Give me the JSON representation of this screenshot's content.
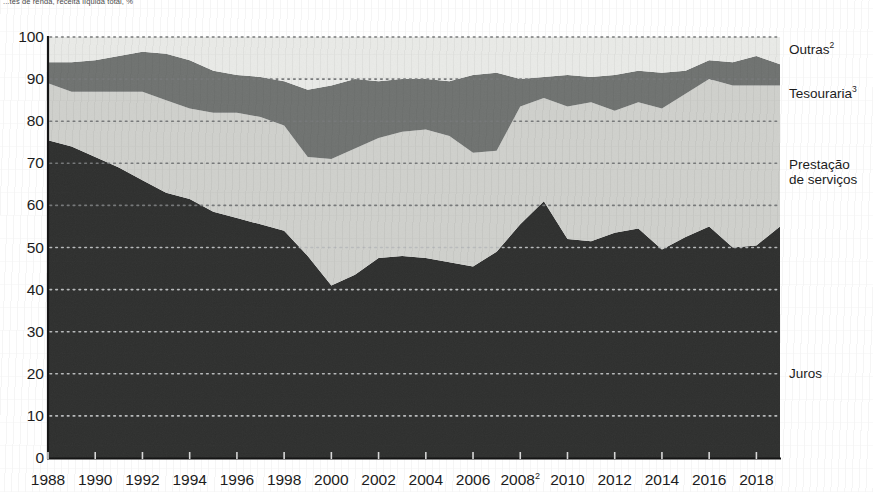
{
  "caption": "...tes de renda, receita líquida total, %",
  "legend": [
    {
      "key": "outras",
      "label": "Outras",
      "sup": "2",
      "color": "#e9eae7"
    },
    {
      "key": "tesouraria",
      "label": "Tesouraria",
      "sup": "3",
      "color": "#6f7270"
    },
    {
      "key": "prestacao",
      "label": "Prestação",
      "sup": "",
      "color": "#cfd0cc"
    },
    {
      "key": "prestacao2",
      "label": "de serviços",
      "sup": "",
      "color": "#cfd0cc"
    },
    {
      "key": "juros",
      "label": "Juros",
      "sup": "",
      "color": "#2e2f2e"
    }
  ],
  "axis": {
    "y_ticks": [
      0,
      10,
      20,
      30,
      40,
      50,
      60,
      70,
      80,
      90,
      100
    ],
    "x_ticks": [
      "1988",
      "1990",
      "1992",
      "1994",
      "1996",
      "1998",
      "2000",
      "2002",
      "2004",
      "2006",
      "2008",
      "2010",
      "2012",
      "2014",
      "2016",
      "2018"
    ],
    "x_tick_sup": {
      "2008": "2"
    }
  },
  "chart_data": {
    "type": "area",
    "stacked": true,
    "normalized_percent": true,
    "title": "",
    "subtitle": "...tes de renda, receita líquida total, %",
    "xlabel": "",
    "ylabel": "%",
    "ylim": [
      0,
      100
    ],
    "xlim": [
      1988,
      2019
    ],
    "grid": "horizontal-dotted",
    "legend_position": "right-inline",
    "x": [
      1988,
      1989,
      1990,
      1991,
      1992,
      1993,
      1994,
      1995,
      1996,
      1997,
      1998,
      1999,
      2000,
      2001,
      2002,
      2003,
      2004,
      2005,
      2006,
      2007,
      2008,
      2009,
      2010,
      2011,
      2012,
      2013,
      2014,
      2015,
      2016,
      2017,
      2018,
      2019
    ],
    "series": [
      {
        "name": "Juros",
        "color": "#2e2f2e",
        "values": [
          75.5,
          74.0,
          71.5,
          69.0,
          66.0,
          63.0,
          61.5,
          58.5,
          57.0,
          55.5,
          54.0,
          48.0,
          41.0,
          43.5,
          47.5,
          48.0,
          47.5,
          46.5,
          45.5,
          49.0,
          55.5,
          61.0,
          52.0,
          51.5,
          53.5,
          54.5,
          49.5,
          52.5,
          55.0,
          50.0,
          50.5,
          55.0
        ]
      },
      {
        "name": "Prestação de serviços",
        "color": "#cfd0cc",
        "values": [
          13.5,
          13.0,
          15.5,
          18.0,
          21.0,
          22.0,
          21.5,
          23.5,
          25.0,
          25.5,
          25.0,
          23.5,
          30.0,
          30.0,
          28.5,
          29.5,
          30.5,
          30.0,
          27.0,
          24.0,
          28.0,
          24.5,
          31.5,
          33.0,
          29.0,
          30.0,
          33.5,
          34.0,
          35.0,
          38.5,
          38.0,
          33.5
        ]
      },
      {
        "name": "Tesouraria",
        "color": "#6f7270",
        "values": [
          5.0,
          7.0,
          7.5,
          8.5,
          9.5,
          11.0,
          11.5,
          10.0,
          9.0,
          9.5,
          10.5,
          16.0,
          17.5,
          16.5,
          13.5,
          12.5,
          12.0,
          13.0,
          18.5,
          18.5,
          6.5,
          5.0,
          7.5,
          6.0,
          8.5,
          7.5,
          8.5,
          5.5,
          4.5,
          5.5,
          7.0,
          5.0
        ]
      },
      {
        "name": "Outras",
        "color": "#e9eae7",
        "values": [
          6.0,
          6.0,
          5.5,
          4.5,
          3.5,
          4.0,
          5.5,
          8.0,
          9.0,
          9.5,
          10.5,
          12.5,
          11.5,
          10.0,
          10.5,
          10.0,
          10.0,
          10.5,
          9.0,
          8.5,
          10.0,
          9.5,
          9.0,
          9.5,
          9.0,
          8.0,
          8.5,
          8.0,
          5.5,
          6.0,
          4.5,
          6.5
        ]
      }
    ]
  },
  "colors": {
    "juros": "#2e2f2e",
    "prestacao": "#cfd0cc",
    "tesouraria": "#6f7270",
    "outras": "#e9eae7",
    "axis": "#1c1c1c",
    "grid": "#9a9a9a",
    "background": "#ffffff"
  }
}
